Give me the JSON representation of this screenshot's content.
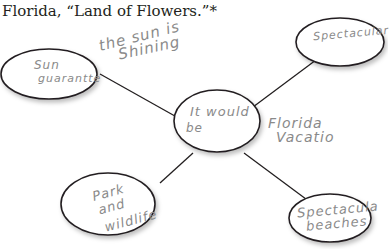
{
  "title": "Florida, “Land of Flowers.”*",
  "diagram": {
    "type": "web / cluster map",
    "center": {
      "line1": "It would",
      "line2": "be",
      "annotation_line1": "Florida",
      "annotation_line2": "Vacatio"
    },
    "nodes": [
      {
        "id": "sun",
        "line1": "Sun",
        "line2": "guarantte",
        "annotation_line1": "the sun is",
        "annotation_line2": "Shining"
      },
      {
        "id": "spectacular",
        "line1": "Spectacular"
      },
      {
        "id": "park",
        "line1": "Park",
        "line2": "and",
        "line3": "wildlife"
      },
      {
        "id": "beaches",
        "line1": "Spectacula",
        "line2": "beaches"
      }
    ]
  },
  "colors": {
    "ink": "#231f20",
    "pencil": "#8a8a8a",
    "erased": "#cfcfcf",
    "background": "#ffffff"
  }
}
